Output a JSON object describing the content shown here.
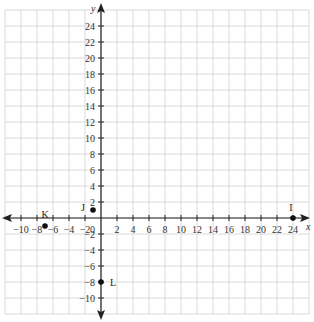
{
  "chart_data": {
    "type": "scatter",
    "title": "",
    "xlabel": "x",
    "ylabel": "y",
    "xlim": [
      -12,
      26
    ],
    "ylim": [
      -12,
      26
    ],
    "grid": true,
    "x_ticks": [
      -10,
      -8,
      -6,
      -4,
      -2,
      2,
      4,
      6,
      8,
      10,
      12,
      14,
      16,
      18,
      20,
      22,
      24
    ],
    "y_ticks": [
      -10,
      -8,
      -6,
      -4,
      -2,
      2,
      4,
      6,
      8,
      10,
      12,
      14,
      16,
      18,
      20,
      22,
      24
    ],
    "origin_label": "0",
    "points": [
      {
        "label": "I",
        "x": 24,
        "y": 0
      },
      {
        "label": "J",
        "x": -1,
        "y": 1
      },
      {
        "label": "K",
        "x": -7,
        "y": -1
      },
      {
        "label": "L",
        "x": 0,
        "y": -8
      }
    ]
  },
  "colors": {
    "grid": "#d9d9d9",
    "axis": "#222222",
    "point": "#111111"
  }
}
